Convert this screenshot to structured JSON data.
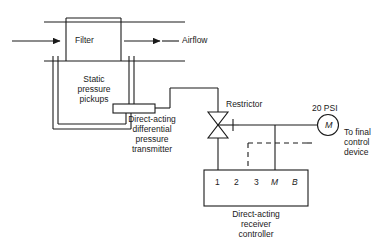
{
  "diagram": {
    "title_implicit": "Direct-acting pneumatic filter differential pressure control loop",
    "stroke_color": "#1a1a1a",
    "background_color": "#ffffff",
    "labels": {
      "filter": "Filter",
      "airflow": "Airflow",
      "static_pressure_pickups": "Static\npressure\npickups",
      "dp_transmitter": "Direct-acting\ndifferential\npressure\ntransmitter",
      "restrictor": "Restrictor",
      "supply_pressure": "20 PSI",
      "motor_symbol": "M",
      "to_final_control_device": "To final\ncontrol\ndevice",
      "receiver_controller": "Direct-acting\nreceiver\ncontroller"
    },
    "controller_terminals": [
      {
        "label": "1",
        "italic": false,
        "connection": "solid"
      },
      {
        "label": "2",
        "italic": false,
        "connection": "none"
      },
      {
        "label": "3",
        "italic": false,
        "connection": "none"
      },
      {
        "label": "M",
        "italic": true,
        "connection": "solid"
      },
      {
        "label": "B",
        "italic": true,
        "connection": "dashed"
      }
    ],
    "icons": {
      "inlet_arrow": "arrow-right-icon",
      "outlet_arrow": "arrow-right-icon",
      "restrictor_valve": "needle-valve-icon",
      "motor_gauge": "motor-circle-icon"
    }
  }
}
